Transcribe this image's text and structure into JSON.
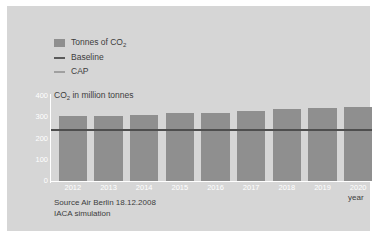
{
  "legend": {
    "items": [
      {
        "label": "Tonnes of CO",
        "sub": "2",
        "key": "bar-swatch",
        "color": "#8f8f8f"
      },
      {
        "label": "Baseline",
        "sub": "",
        "key": "line-swatch",
        "color": "#4e4e4e"
      },
      {
        "label": "CAP",
        "sub": "",
        "key": "line-swatch",
        "color": "#707070"
      }
    ]
  },
  "plot_title": {
    "text": "CO",
    "sub": "2",
    "rest": " in million tonnes"
  },
  "axis_title_x": "year",
  "source": {
    "line1": "Source Air Berlin 18.12.2008",
    "line2": "IACA simulation"
  },
  "colors": {
    "panel": "#d6d6d6",
    "bar": "#8f8f8f",
    "baseline": "#4e4e4e",
    "cap": "#707070",
    "axis": "#ffffff",
    "text": "#3d3d3d"
  },
  "chart_data": {
    "type": "bar",
    "title": "CO2 in million tonnes",
    "xlabel": "year",
    "ylabel": "CO2 in million tonnes",
    "categories": [
      "2012",
      "2013",
      "2014",
      "2015",
      "2016",
      "2017",
      "2018",
      "2019",
      "2020"
    ],
    "values": [
      305,
      306,
      310,
      318,
      320,
      330,
      337,
      345,
      350
    ],
    "ylim": [
      0,
      400
    ],
    "yticks": [
      0,
      100,
      200,
      300,
      400
    ],
    "ytick_labels": [
      "0",
      "100",
      "200",
      "300",
      "400"
    ],
    "grid": false,
    "legend_position": "top-left",
    "series": [
      {
        "name": "Tonnes of CO2",
        "type": "bar",
        "values": [
          305,
          306,
          310,
          318,
          320,
          330,
          337,
          345,
          350
        ]
      },
      {
        "name": "Baseline",
        "type": "hline",
        "value": 240
      },
      {
        "name": "CAP",
        "type": "hline",
        "value": 240
      }
    ],
    "annotations": [
      "Source Air Berlin 18.12.2008",
      "IACA simulation"
    ]
  }
}
